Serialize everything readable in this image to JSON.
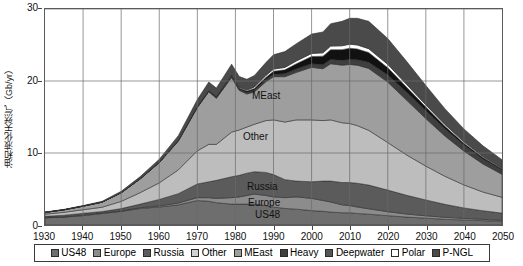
{
  "chart_data": {
    "type": "area",
    "title": "",
    "subtitle": "",
    "xlabel": "",
    "ylabel": "油和液化天然气（Gb/yr）",
    "xlim": [
      1930,
      2050
    ],
    "ylim": [
      0,
      30
    ],
    "xticks": [
      1930,
      1940,
      1950,
      1960,
      1970,
      1980,
      1990,
      2000,
      2010,
      2020,
      2030,
      2040,
      2050
    ],
    "yticks": [
      0,
      10,
      20,
      30
    ],
    "grid": true,
    "stacked": true,
    "legend_position": "bottom",
    "x": [
      1930,
      1935,
      1940,
      1945,
      1950,
      1955,
      1960,
      1965,
      1970,
      1973,
      1975,
      1979,
      1981,
      1983,
      1985,
      1988,
      1990,
      1993,
      1996,
      2000,
      2003,
      2005,
      2008,
      2010,
      2012,
      2015,
      2020,
      2025,
      2030,
      2035,
      2040,
      2045,
      2050
    ],
    "series": [
      {
        "name": "US48",
        "color": "#6e6e6e",
        "values": [
          1.0,
          1.1,
          1.3,
          1.6,
          1.9,
          2.3,
          2.5,
          2.8,
          3.4,
          3.3,
          3.1,
          2.9,
          2.9,
          2.9,
          2.9,
          2.7,
          2.5,
          2.3,
          2.2,
          2.0,
          1.9,
          1.8,
          1.7,
          1.7,
          1.6,
          1.5,
          1.3,
          1.1,
          0.95,
          0.8,
          0.7,
          0.6,
          0.5
        ]
      },
      {
        "name": "Europe",
        "color": "#8c8c8c",
        "values": [
          0.05,
          0.06,
          0.07,
          0.07,
          0.08,
          0.1,
          0.15,
          0.25,
          0.4,
          0.5,
          0.6,
          0.9,
          1.0,
          1.2,
          1.4,
          1.4,
          1.4,
          1.5,
          1.7,
          1.7,
          1.5,
          1.4,
          1.1,
          1.0,
          0.9,
          0.75,
          0.55,
          0.42,
          0.33,
          0.27,
          0.22,
          0.18,
          0.15
        ]
      },
      {
        "name": "Russia",
        "color": "#5b5b5b",
        "values": [
          0.15,
          0.2,
          0.25,
          0.2,
          0.3,
          0.5,
          0.9,
          1.3,
          1.9,
          2.2,
          2.5,
          2.9,
          3.0,
          3.1,
          3.1,
          3.2,
          3.1,
          2.5,
          2.2,
          2.3,
          2.7,
          2.9,
          3.1,
          3.2,
          3.3,
          3.3,
          3.0,
          2.6,
          2.2,
          1.8,
          1.45,
          1.2,
          1.0
        ]
      },
      {
        "name": "Other",
        "color": "#bdbdbd",
        "values": [
          0.3,
          0.4,
          0.5,
          0.6,
          1.0,
          1.6,
          2.3,
          3.3,
          4.6,
          5.2,
          5.0,
          6.2,
          6.3,
          6.4,
          6.6,
          7.2,
          7.6,
          8.0,
          8.5,
          8.6,
          8.4,
          8.5,
          8.3,
          8.2,
          8.0,
          7.6,
          6.6,
          5.6,
          4.7,
          3.9,
          3.2,
          2.6,
          2.2
        ]
      },
      {
        "name": "MEast",
        "color": "#9e9e9e",
        "values": [
          0.25,
          0.35,
          0.5,
          0.7,
          1.2,
          1.9,
          2.8,
          4.0,
          6.0,
          7.3,
          6.4,
          7.6,
          5.5,
          4.6,
          4.5,
          5.4,
          6.0,
          6.3,
          6.6,
          7.3,
          7.2,
          7.8,
          8.0,
          8.2,
          8.4,
          8.6,
          8.4,
          7.6,
          6.6,
          5.6,
          4.7,
          3.9,
          3.2
        ]
      },
      {
        "name": "Heavy",
        "color": "#3f3f3f",
        "values": [
          0.0,
          0.0,
          0.0,
          0.0,
          0.0,
          0.02,
          0.04,
          0.06,
          0.1,
          0.12,
          0.14,
          0.18,
          0.2,
          0.22,
          0.25,
          0.3,
          0.35,
          0.4,
          0.45,
          0.5,
          0.55,
          0.6,
          0.65,
          0.7,
          0.75,
          0.85,
          1.0,
          1.1,
          1.1,
          1.0,
          0.85,
          0.7,
          0.6
        ]
      },
      {
        "name": "Deepwater",
        "color": "#111111",
        "values": [
          0.0,
          0.0,
          0.0,
          0.0,
          0.0,
          0.0,
          0.0,
          0.0,
          0.02,
          0.04,
          0.06,
          0.1,
          0.14,
          0.18,
          0.22,
          0.3,
          0.4,
          0.55,
          0.75,
          1.0,
          1.2,
          1.35,
          1.5,
          1.55,
          1.5,
          1.35,
          1.0,
          0.7,
          0.5,
          0.35,
          0.25,
          0.18,
          0.12
        ]
      },
      {
        "name": "Polar",
        "color": "#ffffff",
        "values": [
          0.0,
          0.0,
          0.0,
          0.0,
          0.0,
          0.0,
          0.0,
          0.0,
          0.0,
          0.0,
          0.02,
          0.06,
          0.1,
          0.14,
          0.2,
          0.26,
          0.3,
          0.34,
          0.38,
          0.42,
          0.46,
          0.5,
          0.54,
          0.56,
          0.56,
          0.54,
          0.46,
          0.38,
          0.3,
          0.24,
          0.18,
          0.14,
          0.1
        ]
      },
      {
        "name": "P-NGL",
        "color": "#4a4a4a",
        "values": [
          0.05,
          0.06,
          0.08,
          0.12,
          0.2,
          0.3,
          0.45,
          0.7,
          1.0,
          1.2,
          1.2,
          1.5,
          1.5,
          1.5,
          1.6,
          1.8,
          2.0,
          2.2,
          2.4,
          2.7,
          2.9,
          3.1,
          3.4,
          3.6,
          3.7,
          3.8,
          3.6,
          3.2,
          2.7,
          2.2,
          1.8,
          1.5,
          1.2
        ]
      }
    ]
  },
  "legend": {
    "items": [
      {
        "label": "US48",
        "color": "#6e6e6e"
      },
      {
        "label": "Europe",
        "color": "#8c8c8c"
      },
      {
        "label": "Russia",
        "color": "#5b5b5b"
      },
      {
        "label": "Other",
        "color": "#d2d2d2"
      },
      {
        "label": "MEast",
        "color": "#9e9e9e"
      },
      {
        "label": "Heavy",
        "color": "#3f3f3f"
      },
      {
        "label": "Deepwater",
        "color": "#555555"
      },
      {
        "label": "Polar",
        "color": "#ffffff"
      },
      {
        "label": "P-NGL",
        "color": "#4a4a4a"
      }
    ]
  },
  "annotations": [
    {
      "text": "MEast",
      "x": 252,
      "y": 90
    },
    {
      "text": "Other",
      "x": 243,
      "y": 131
    },
    {
      "text": "Russia",
      "x": 247,
      "y": 181
    },
    {
      "text": "Europe",
      "x": 248,
      "y": 197
    },
    {
      "text": "US48",
      "x": 255,
      "y": 209
    }
  ]
}
